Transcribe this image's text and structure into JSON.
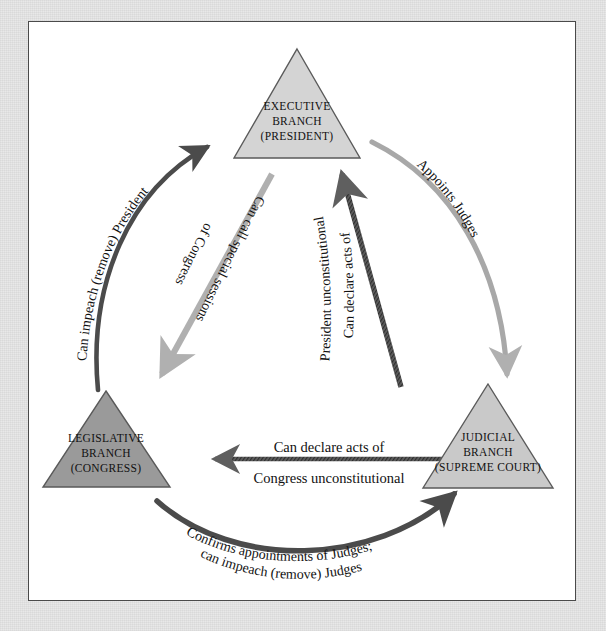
{
  "diagram": {
    "type": "cycle-diagram",
    "colors": {
      "page_mat": "#e8e8e8",
      "canvas": "#ffffff",
      "canvas_border": "#4a4a4a",
      "triangle_light_fill": "#d4d4d4",
      "triangle_dark_fill": "#9a9a9a",
      "triangle_stroke": "#5a5a5a",
      "arrow_dark": "#4b4b4b",
      "arrow_light": "#b0b0b0",
      "arrow_mid": "#6e6e6e",
      "text": "#111111"
    },
    "nodes": [
      {
        "id": "executive",
        "lines": [
          "EXECUTIVE",
          "BRANCH",
          "(PRESIDENT)"
        ],
        "shade": "light",
        "position": "top"
      },
      {
        "id": "legislative",
        "lines": [
          "LEGISLATIVE",
          "BRANCH",
          "(CONGRESS)"
        ],
        "shade": "dark",
        "position": "bottom-left"
      },
      {
        "id": "judicial",
        "lines": [
          "JUDICIAL",
          "BRANCH",
          "(SUPREME COURT)"
        ],
        "shade": "light",
        "position": "bottom-right"
      }
    ],
    "arrows": [
      {
        "id": "impeach-president",
        "from": "legislative",
        "to": "executive",
        "style": "dark",
        "lines": [
          "Can impeach (remove) President"
        ]
      },
      {
        "id": "call-special-sessions",
        "from": "executive",
        "to": "legislative",
        "style": "light",
        "lines": [
          "Can call special sessions",
          "of Congress"
        ]
      },
      {
        "id": "appoints-judges",
        "from": "executive",
        "to": "judicial",
        "style": "light",
        "lines": [
          "Appoints Judges"
        ]
      },
      {
        "id": "declare-president-acts-unconstitutional",
        "from": "judicial",
        "to": "executive",
        "style": "dark",
        "lines": [
          "Can declare acts of",
          "President unconstitutional"
        ]
      },
      {
        "id": "declare-congress-acts-unconstitutional",
        "from": "judicial",
        "to": "legislative",
        "style": "dark-straight",
        "lines": [
          "Can declare acts of",
          "Congress unconstitutional"
        ]
      },
      {
        "id": "confirm-impeach-judges",
        "from": "legislative",
        "to": "judicial",
        "style": "dark",
        "lines": [
          "Confirms appointments of Judges;",
          "can impeach (remove) Judges"
        ]
      }
    ]
  }
}
